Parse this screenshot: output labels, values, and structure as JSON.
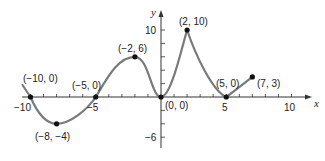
{
  "chart_data": {
    "type": "line",
    "title": "",
    "xlabel": "x",
    "ylabel": "y",
    "xlim": [
      -10,
      10
    ],
    "ylim": [
      -6,
      10
    ],
    "grid": false,
    "x_ticks": [
      -10,
      -5,
      5,
      10
    ],
    "x_tick_labels": [
      "−10",
      "−5",
      "5",
      "10"
    ],
    "y_ticks": [
      10,
      -6
    ],
    "y_tick_labels": [
      "10",
      "−6"
    ],
    "points": [
      {
        "x": -10,
        "y": 0,
        "label": "(−10, 0)"
      },
      {
        "x": -8,
        "y": -4,
        "label": "(−8, −4)"
      },
      {
        "x": -5,
        "y": 0,
        "label": "(−5, 0)"
      },
      {
        "x": -2,
        "y": 6,
        "label": "(−2, 6)"
      },
      {
        "x": 0,
        "y": 0,
        "label": "(0, 0)"
      },
      {
        "x": 2,
        "y": 10,
        "label": "(2, 10)"
      },
      {
        "x": 5,
        "y": 0,
        "label": "(5, 0)"
      },
      {
        "x": 7,
        "y": 3,
        "label": "(7, 3)"
      }
    ],
    "series": [
      {
        "name": "f(x)",
        "x": [
          -10,
          -8,
          -5,
          -2,
          0,
          2,
          5,
          7
        ],
        "values": [
          0,
          -4,
          0,
          6,
          0,
          10,
          0,
          3
        ]
      }
    ],
    "colors": {
      "curve": "#7a7a7a",
      "axis": "#333333",
      "point": "#111111"
    }
  }
}
